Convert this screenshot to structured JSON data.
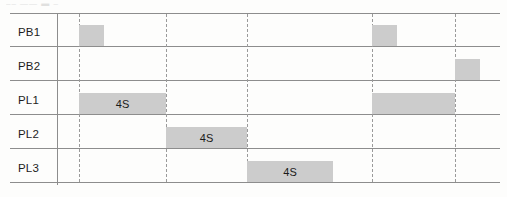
{
  "artifact": {
    "top_text": "––  ——   ▬ –"
  },
  "diagram": {
    "type": "timing-diagram",
    "rows": [
      {
        "label": "PB1"
      },
      {
        "label": "PB2"
      },
      {
        "label": "PL1"
      },
      {
        "label": "PL2"
      },
      {
        "label": "PL3"
      }
    ],
    "duration_label": "4S",
    "colors": {
      "block_fill": "#cccccc",
      "line": "#8d8d8d",
      "tick": "#9a9a9a",
      "arrow": "#1a1a1a",
      "text": "#1d1d1d"
    },
    "ticks": [
      {
        "name": "t0",
        "x": 69
      },
      {
        "name": "t1",
        "x": 156
      },
      {
        "name": "t2",
        "x": 237
      },
      {
        "name": "t3",
        "x": 362
      },
      {
        "name": "t4",
        "x": 445
      }
    ],
    "signals": [
      {
        "name": "PB1",
        "pulses": [
          {
            "x": 69,
            "width": 25
          },
          {
            "x": 362,
            "width": 25
          }
        ]
      },
      {
        "name": "PB2",
        "pulses": [
          {
            "x": 445,
            "width": 25
          }
        ]
      },
      {
        "name": "PL1",
        "pulses": [
          {
            "x": 69,
            "width": 87,
            "duration": "4S",
            "dimensioned": true
          },
          {
            "x": 362,
            "width": 83,
            "duration": "",
            "dimensioned": false
          }
        ]
      },
      {
        "name": "PL2",
        "pulses": [
          {
            "x": 156,
            "width": 81,
            "duration": "4S",
            "dimensioned": true
          }
        ]
      },
      {
        "name": "PL3",
        "pulses": [
          {
            "x": 237,
            "width": 86,
            "duration": "4S",
            "dimensioned": true
          }
        ]
      }
    ]
  }
}
